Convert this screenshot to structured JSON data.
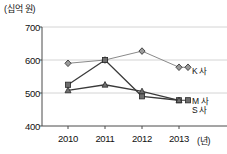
{
  "chart_data": {
    "type": "line",
    "title": "",
    "subtitle": "",
    "xlabel": "(년)",
    "ylabel": "(십억 원)",
    "categories": [
      "2010",
      "2011",
      "2012",
      "2013"
    ],
    "x": [
      2010,
      2011,
      2012,
      2013
    ],
    "ylim": [
      400,
      700
    ],
    "yticks": [
      400,
      500,
      600,
      700
    ],
    "grid": true,
    "legend_position": "right-inline",
    "series": [
      {
        "name": "K 사",
        "marker": "diamond",
        "color": "#8a8a8a",
        "values": [
          590,
          600,
          627,
          578
        ]
      },
      {
        "name": "M 사",
        "marker": "square",
        "color": "#3a3a3a",
        "values": [
          525,
          600,
          490,
          478
        ]
      },
      {
        "name": "S 사",
        "marker": "triangle",
        "color": "#3a3a3a",
        "values": [
          508,
          525,
          505,
          478
        ]
      }
    ]
  },
  "axis": {
    "unit_label": "(십억 원)",
    "x_unit_label": "(년)",
    "y_ticks": [
      "700",
      "600",
      "500",
      "400"
    ],
    "x_ticks": [
      "2010",
      "2011",
      "2012",
      "2013"
    ]
  },
  "legend": {
    "k_label": "K 사",
    "m_label": "M 사",
    "s_label": "S 사"
  },
  "colors": {
    "grid": "#c9c9c9",
    "axis": "#4a4a4a",
    "series_k": "#8a8a8a",
    "series_m": "#3a3a3a",
    "series_s": "#3a3a3a",
    "background": "#ffffff"
  }
}
